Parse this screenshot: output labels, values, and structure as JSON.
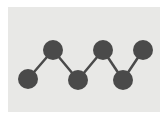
{
  "canvas": {
    "width": 168,
    "height": 127,
    "page_background": "#ffffff"
  },
  "panel": {
    "x": 8,
    "y": 7,
    "width": 152,
    "height": 105,
    "background": "#e8e8e6"
  },
  "graph": {
    "title": "",
    "node_color": "#4a4a4a",
    "edge_color": "#4a4a4a",
    "node_radius": 10,
    "edge_width": 2.5,
    "nodes": [
      {
        "id": "n1",
        "label": "",
        "cx": 28,
        "cy": 79,
        "level": "low"
      },
      {
        "id": "n2",
        "label": "",
        "cx": 53,
        "cy": 50,
        "level": "high"
      },
      {
        "id": "n3",
        "label": "",
        "cx": 78,
        "cy": 80,
        "level": "low"
      },
      {
        "id": "n4",
        "label": "",
        "cx": 103,
        "cy": 50,
        "level": "high"
      },
      {
        "id": "n5",
        "label": "",
        "cx": 123,
        "cy": 80,
        "level": "low"
      },
      {
        "id": "n6",
        "label": "",
        "cx": 143,
        "cy": 50,
        "level": "high"
      }
    ],
    "edges": [
      {
        "from": "n1",
        "to": "n2"
      },
      {
        "from": "n2",
        "to": "n3"
      },
      {
        "from": "n3",
        "to": "n4"
      },
      {
        "from": "n4",
        "to": "n5"
      },
      {
        "from": "n5",
        "to": "n6"
      }
    ]
  }
}
